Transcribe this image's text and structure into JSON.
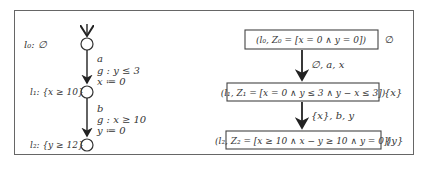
{
  "automaton": {
    "locations": [
      {
        "id": "l0",
        "label": "l₀: ∅"
      },
      {
        "id": "l1",
        "label": "l₁: {x ≥ 10}"
      },
      {
        "id": "l2",
        "label": "l₂: {y ≥ 12}"
      }
    ],
    "edges": [
      {
        "from": "l0",
        "to": "l1",
        "action": "a",
        "guard": "g : y ≤ 3",
        "reset": "x ≔ 0"
      },
      {
        "from": "l1",
        "to": "l2",
        "action": "b",
        "guard": "g : x ≥ 10",
        "reset": "y ≔ 0"
      }
    ]
  },
  "zone_graph": {
    "nodes": [
      {
        "label": "(l₀, Z₀ = [x = 0 ∧ y = 0])",
        "side": "∅"
      },
      {
        "label": "(l₁, Z₁ = [x = 0 ∧ y ≤ 3 ∧ y − x ≤ 3])",
        "side": "{x}"
      },
      {
        "label": "(l₂, Z₂ = [x ≥ 10 ∧ x − y ≥ 10 ∧ y = 0])",
        "side": "{y}"
      }
    ],
    "edges": [
      {
        "label": "∅, a, x"
      },
      {
        "label": "{x}, b, y"
      }
    ]
  }
}
